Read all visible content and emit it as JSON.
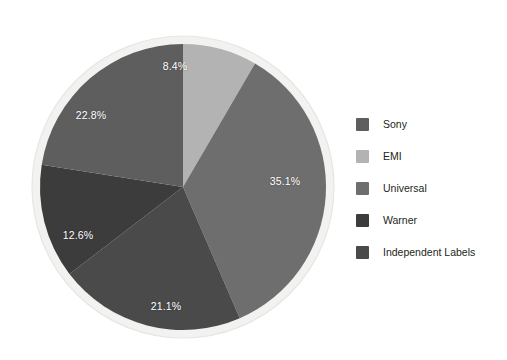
{
  "chart_data": {
    "type": "pie",
    "title": "",
    "subtitle": "",
    "xlabel": "",
    "ylabel": "",
    "grid": false,
    "legend_position": "right",
    "start_angle_deg": 0,
    "direction": "clockwise",
    "units": "percent",
    "categories": [
      "Sony",
      "EMI",
      "Universal",
      "Warner",
      "Independent Labels"
    ],
    "values": [
      22.8,
      8.4,
      35.1,
      12.6,
      21.1
    ],
    "slices": [
      {
        "name": "EMI",
        "value": 8.4,
        "label": "8.4%",
        "color": "#b3b3b3",
        "start_deg": 0,
        "end_deg": 30.24,
        "label_x": 145,
        "label_y": 32
      },
      {
        "name": "Universal",
        "value": 35.1,
        "label": "35.1%",
        "color": "#6e6e6e",
        "start_deg": 30.24,
        "end_deg": 156.6,
        "label_x": 255,
        "label_y": 147
      },
      {
        "name": "Independent Labels",
        "value": 21.1,
        "label": "21.1%",
        "color": "#4a4a4a",
        "start_deg": 156.6,
        "end_deg": 232.56,
        "label_x": 136,
        "label_y": 272
      },
      {
        "name": "Warner",
        "value": 12.6,
        "label": "12.6%",
        "color": "#3c3c3c",
        "start_deg": 232.56,
        "end_deg": 278.92,
        "label_x": 48,
        "label_y": 201
      },
      {
        "name": "Sony",
        "value": 22.8,
        "label": "22.8%",
        "color": "#5e5e5e",
        "start_deg": 278.92,
        "end_deg": 360,
        "label_x": 61,
        "label_y": 81
      }
    ],
    "legend": [
      {
        "label": "Sony",
        "color": "#5e5e5e"
      },
      {
        "label": "EMI",
        "color": "#b3b3b3"
      },
      {
        "label": "Universal",
        "color": "#6e6e6e"
      },
      {
        "label": "Warner",
        "color": "#3c3c3c"
      },
      {
        "label": "Independent Labels",
        "color": "#4a4a4a"
      }
    ]
  },
  "style": {
    "background": "#ffffff",
    "pie_ring_color": "#f2f2f0",
    "pie_edge_color": "#e3e3e1",
    "label_text_color": "#ffffff",
    "legend_text_color": "#231f20"
  }
}
